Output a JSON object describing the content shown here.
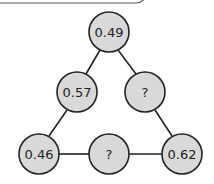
{
  "diagram": {
    "type": "number-triangle",
    "nodes": [
      {
        "id": "top",
        "label": "0.49",
        "x": 109,
        "y": 32
      },
      {
        "id": "left-mid",
        "label": "0.57",
        "x": 77,
        "y": 92
      },
      {
        "id": "right-mid",
        "label": "?",
        "x": 145,
        "y": 92
      },
      {
        "id": "bottom-left",
        "label": "0.46",
        "x": 39,
        "y": 154
      },
      {
        "id": "bottom-mid",
        "label": "?",
        "x": 109,
        "y": 154
      },
      {
        "id": "bottom-right",
        "label": "0.62",
        "x": 182,
        "y": 154
      }
    ],
    "colors": {
      "node_fill": "#d9d9d9",
      "stroke": "#222222"
    }
  }
}
